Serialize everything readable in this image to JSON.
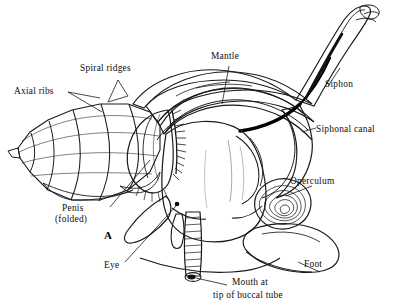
{
  "figure": {
    "marker": "A",
    "background_color": "#ffffff",
    "ink_color": "#1a1a1a"
  },
  "labels": {
    "spiral_ridges": "Spiral ridges",
    "axial_ribs": "Axial ribs",
    "mantle": "Mantle",
    "siphon": "Siphon",
    "siphonal_canal": "Siphonal canal",
    "operculum": "Operculum",
    "penis_line1": "Penis",
    "penis_line2": "(folded)",
    "eye": "Eye",
    "foot": "Foot",
    "mouth_line1": "Mouth at",
    "mouth_line2": "tip of buccal tube"
  },
  "parts": [
    {
      "id": "shell-spire",
      "name": "shell-spire"
    },
    {
      "id": "body-whorl",
      "name": "body-whorl"
    },
    {
      "id": "mantle",
      "name": "mantle"
    },
    {
      "id": "siphon",
      "name": "siphon"
    },
    {
      "id": "siphonal-canal",
      "name": "siphonal-canal"
    },
    {
      "id": "operculum",
      "name": "operculum"
    },
    {
      "id": "penis",
      "name": "penis-folded"
    },
    {
      "id": "eye",
      "name": "eye"
    },
    {
      "id": "foot",
      "name": "foot"
    },
    {
      "id": "buccal-tube",
      "name": "buccal-tube"
    },
    {
      "id": "mouth",
      "name": "mouth"
    }
  ]
}
